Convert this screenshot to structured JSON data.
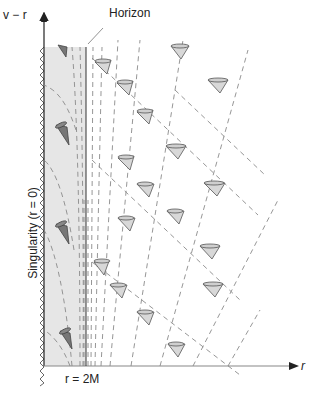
{
  "labels": {
    "y_axis": "v − r",
    "x_axis": "r",
    "horizon": "Horizon",
    "horizon_radius": "r = 2M",
    "singularity": "Singularity (r = 0)"
  },
  "colors": {
    "interior_shade": "#e6e6e6",
    "axis": "#222222",
    "dashed_line": "#8a8a8a",
    "cone_outside": "#d8d8d8",
    "cone_inside": "#777777"
  },
  "diagram": {
    "type": "Eddington-Finkelstein light cone diagram",
    "regions": [
      "interior (shaded, r < 2M)",
      "exterior (r > 2M)"
    ],
    "light_cones_outside": 17,
    "light_cones_inside": 4
  }
}
